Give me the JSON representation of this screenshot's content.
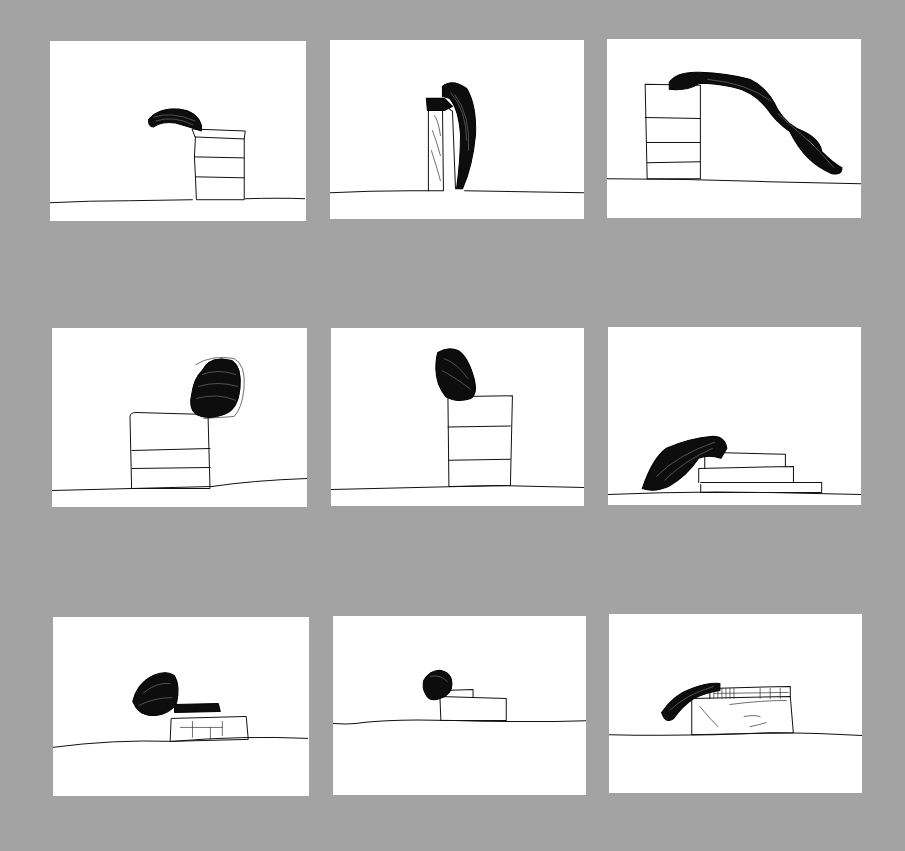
{
  "sheet": {
    "background_color": "#a3a3a3",
    "paper_color": "#ffffff",
    "ink_color": "#0d0d0d",
    "layout": {
      "rows": 3,
      "columns": 3
    },
    "panels": [
      {
        "id": 1,
        "description": "Dark curved form draped on top of a three-drawer stack on a ground line"
      },
      {
        "id": 2,
        "description": "Tall dark crescent form leaning against a tall narrow block"
      },
      {
        "id": 3,
        "description": "Long dark ribbon form sliding from a four-tier stack down to the ground"
      },
      {
        "id": 4,
        "description": "Dark rounded block resting at the corner of a three-tier stack"
      },
      {
        "id": 5,
        "description": "Small dark rounded block on top of a three-tier tower"
      },
      {
        "id": 6,
        "description": "Dark draped form slumped over a three-step staircase"
      },
      {
        "id": 7,
        "description": "Dark oval form and a flat textured slab on a low box"
      },
      {
        "id": 8,
        "description": "Small dark round form beside a two-step low block"
      },
      {
        "id": 9,
        "description": "Dark curved arm over a ruled strip atop a low box"
      }
    ]
  }
}
